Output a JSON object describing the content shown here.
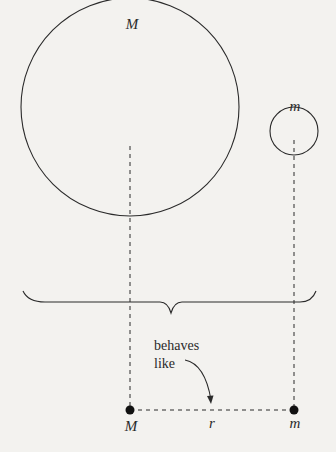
{
  "diagram": {
    "big_body": {
      "label": "M",
      "cx": 130,
      "cy": 107,
      "r": 109
    },
    "small_body": {
      "label": "m",
      "cx": 294,
      "cy": 117,
      "r": 24
    },
    "brace": {
      "x1": 23,
      "x2": 316,
      "y": 302,
      "tip_x": 171,
      "tip_y": 316
    },
    "annotation": {
      "line1": "behaves",
      "line2": "like"
    },
    "point_masses": {
      "left": {
        "label": "M",
        "x": 130,
        "y": 410
      },
      "right": {
        "label": "m",
        "x": 294,
        "y": 410
      },
      "distance_label": "r"
    },
    "colors": {
      "background": "#f3f2ef",
      "ink": "#2a2a2a"
    }
  }
}
